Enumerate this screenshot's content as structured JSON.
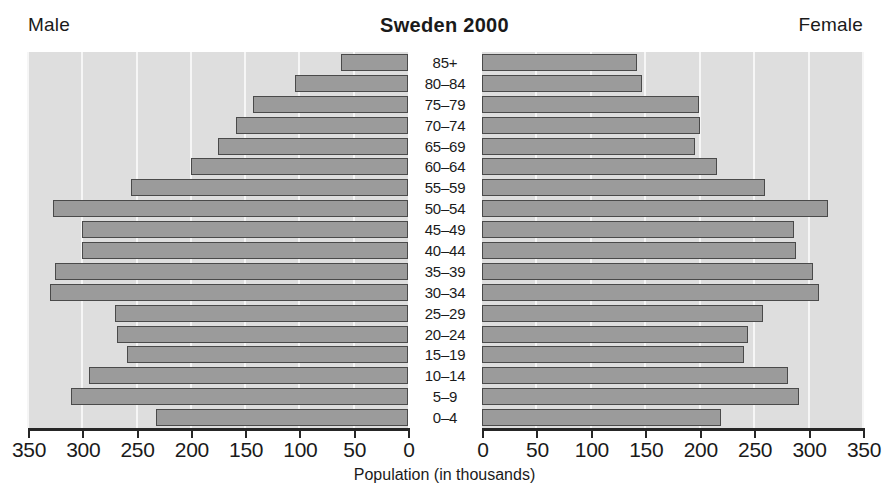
{
  "header": {
    "left_label": "Male",
    "title": "Sweden 2000",
    "right_label": "Female"
  },
  "axis": {
    "title": "Population (in thousands)",
    "tick_labels_male": [
      "350",
      "300",
      "250",
      "200",
      "150",
      "100",
      "50",
      "0"
    ],
    "tick_labels_female": [
      "0",
      "50",
      "100",
      "150",
      "200",
      "250",
      "300",
      "350"
    ],
    "max": 350,
    "step": 50
  },
  "colors": {
    "bar_fill": "#9b9b9b",
    "bar_stroke": "#4a4a4a",
    "panel_background": "#dedede",
    "gridline": "#f6f6f6",
    "axis": "#262626",
    "text": "#1a1a1a"
  },
  "chart_data": {
    "type": "bar",
    "subtype": "population-pyramid",
    "title": "Sweden 2000",
    "xlabel": "Population (in thousands)",
    "ylabel": "",
    "xlim": [
      0,
      350
    ],
    "grid": true,
    "legend_position": "top-corners",
    "categories": [
      "85+",
      "80–84",
      "75–79",
      "70–74",
      "65–69",
      "60–64",
      "55–59",
      "50–54",
      "45–49",
      "40–44",
      "35–39",
      "30–34",
      "25–29",
      "20–24",
      "15–19",
      "10–14",
      "5–9",
      "0–4"
    ],
    "series": [
      {
        "name": "Male",
        "side": "left",
        "values": [
          62,
          104,
          143,
          158,
          175,
          200,
          255,
          327,
          300,
          300,
          325,
          330,
          270,
          268,
          259,
          294,
          310,
          232
        ]
      },
      {
        "name": "Female",
        "side": "right",
        "values": [
          142,
          147,
          199,
          200,
          196,
          216,
          260,
          318,
          287,
          288,
          304,
          310,
          258,
          244,
          241,
          281,
          291,
          220
        ]
      }
    ]
  }
}
